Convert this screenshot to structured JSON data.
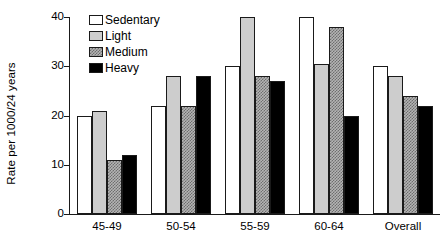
{
  "chart_data": {
    "type": "bar",
    "title": "",
    "subtitle": "",
    "xlabel": "",
    "ylabel": "Rate per 1000/24 years",
    "ylim": [
      0,
      40
    ],
    "yticks": [
      0,
      10,
      20,
      30,
      40
    ],
    "ytick_labels": [
      "0",
      "10",
      "20",
      "30",
      "40"
    ],
    "grid": false,
    "legend_position": "top-left-inside",
    "categories": [
      "45-49",
      "50-54",
      "55-59",
      "60-64",
      "Overall"
    ],
    "series": [
      {
        "name": "Sedentary",
        "color": "#ffffff",
        "fill": "white",
        "values": [
          20,
          22,
          30,
          40,
          30
        ]
      },
      {
        "name": "Light",
        "color": "#cdcdcd",
        "fill": "lightgray",
        "values": [
          21,
          28,
          40,
          30.5,
          28
        ]
      },
      {
        "name": "Medium",
        "color": "#b4b4b4",
        "fill": "checker",
        "values": [
          11,
          22,
          28,
          38,
          24
        ]
      },
      {
        "name": "Heavy",
        "color": "#000000",
        "fill": "black",
        "values": [
          12,
          28,
          27,
          20,
          22
        ]
      }
    ]
  },
  "legend": {
    "items": [
      {
        "label": "Sedentary"
      },
      {
        "label": "Light"
      },
      {
        "label": "Medium"
      },
      {
        "label": "Heavy"
      }
    ]
  }
}
